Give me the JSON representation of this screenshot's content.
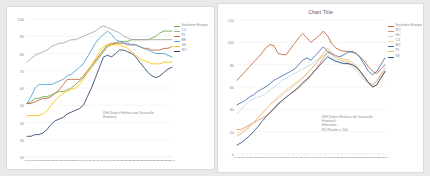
{
  "chart_data": [
    {
      "id": "left",
      "type": "line",
      "title": "",
      "xlabel": "",
      "ylabel": "",
      "ylim": [
        20,
        100
      ],
      "yticks": [
        20,
        30,
        40,
        50,
        60,
        70,
        80,
        90,
        100
      ],
      "grid": true,
      "legend_position": "right",
      "annotation": "IDH (Índice Histórico de Desarrollo\nHumano)",
      "x": [
        "1977",
        "1978",
        "1979",
        "1980",
        "1981",
        "1982",
        "1983",
        "1984",
        "1985",
        "1986",
        "1987",
        "1988",
        "1989",
        "1990",
        "1991",
        "1992",
        "1993",
        "1994",
        "1995",
        "1996",
        "1997",
        "1998",
        "1999",
        "2000",
        "2001",
        "2002",
        "2003",
        "2004",
        "2005",
        "2006",
        "2007",
        "2008",
        "2009",
        "2010",
        "2011",
        "2012",
        "2013"
      ],
      "series": [
        {
          "name": "Southern Europe",
          "color": "#70A845",
          "values": [
            51,
            52,
            54,
            54,
            55,
            55,
            56,
            57,
            58,
            58,
            59,
            60,
            62,
            64,
            66,
            69,
            72,
            75,
            78,
            81,
            84,
            85,
            86,
            87,
            87,
            87,
            88,
            88,
            88,
            88,
            88,
            89,
            90,
            92,
            93,
            93,
            93
          ]
        },
        {
          "name": "LU",
          "color": "#A5A5A5",
          "values": [
            75,
            77,
            79,
            80,
            81,
            82,
            84,
            85,
            86,
            86,
            87,
            88,
            88,
            89,
            90,
            91,
            92,
            93,
            95,
            96,
            95,
            94,
            93,
            92,
            90,
            89,
            88,
            88,
            88,
            88,
            88,
            88,
            88,
            88,
            88,
            88,
            88
          ]
        },
        {
          "name": "PL",
          "color": "#C0653C",
          "values": [
            51,
            51,
            52,
            53,
            54,
            54,
            55,
            57,
            59,
            62,
            65,
            65,
            65,
            65,
            67,
            70,
            73,
            76,
            79,
            82,
            85,
            86,
            86,
            86,
            86,
            85,
            85,
            85,
            84,
            83,
            83,
            82,
            82,
            82,
            83,
            83,
            84
          ]
        },
        {
          "name": "BE",
          "color": "#4F9FD4",
          "values": [
            51,
            55,
            60,
            62,
            62,
            62,
            62,
            63,
            64,
            65,
            67,
            68,
            70,
            72,
            74,
            78,
            82,
            86,
            89,
            91,
            93,
            91,
            88,
            87,
            86,
            86,
            85,
            85,
            84,
            83,
            82,
            81,
            80,
            80,
            80,
            79,
            78
          ]
        },
        {
          "name": "SK",
          "color": "#FFC000",
          "values": [
            44,
            44,
            44,
            44,
            45,
            47,
            50,
            53,
            55,
            57,
            58,
            59,
            60,
            62,
            65,
            69,
            73,
            77,
            81,
            84,
            85,
            85,
            85,
            85,
            84,
            83,
            81,
            79,
            77,
            76,
            75,
            74,
            74,
            74,
            75,
            75,
            75
          ]
        },
        {
          "name": "RO",
          "color": "#26456E",
          "values": [
            32,
            32,
            33,
            33,
            34,
            36,
            39,
            41,
            42,
            43,
            45,
            46,
            47,
            48,
            50,
            55,
            60,
            66,
            72,
            78,
            79,
            78,
            80,
            82,
            82,
            81,
            80,
            78,
            75,
            72,
            69,
            67,
            66,
            67,
            69,
            71,
            72
          ]
        }
      ]
    },
    {
      "id": "right",
      "type": "line",
      "title": "Chart Title",
      "xlabel": "",
      "ylabel": "",
      "ylim": [
        0,
        120
      ],
      "yticks": [
        0,
        20,
        40,
        60,
        80,
        100,
        120
      ],
      "grid": true,
      "legend_position": "right",
      "annotation": "IDH (Índice Histórico de Desarrollo\nHumano)\nEducation\nEU Flanker = 100",
      "x": [
        "1977",
        "1978",
        "1979",
        "1980",
        "1981",
        "1982",
        "1983",
        "1984",
        "1985",
        "1986",
        "1987",
        "1988",
        "1989",
        "1990",
        "1991",
        "1992",
        "1993",
        "1994",
        "1995",
        "1996",
        "1997",
        "1998",
        "1999",
        "2000",
        "2001",
        "2002",
        "2003",
        "2004",
        "2005",
        "2006",
        "2007",
        "2008",
        "2009",
        "2010",
        "2011",
        "2012",
        "2013"
      ],
      "series": [
        {
          "name": "Southern Europe",
          "color": "#C0653C",
          "values": [
            66,
            70,
            74,
            78,
            82,
            86,
            90,
            95,
            98,
            97,
            90,
            89,
            89,
            94,
            99,
            104,
            108,
            104,
            100,
            103,
            106,
            110,
            106,
            99,
            95,
            93,
            92,
            92,
            91,
            90,
            87,
            83,
            78,
            74,
            72,
            76,
            80
          ]
        },
        {
          "name": "RO",
          "color": "#D9945F",
          "values": [
            22,
            22,
            24,
            26,
            28,
            30,
            32,
            34,
            37,
            40,
            44,
            48,
            51,
            54,
            56,
            59,
            63,
            66,
            70,
            75,
            80,
            86,
            91,
            89,
            86,
            84,
            83,
            82,
            80,
            77,
            73,
            68,
            63,
            60,
            62,
            68,
            73
          ]
        },
        {
          "name": "HU",
          "color": "#BFDCEF",
          "values": [
            36,
            40,
            44,
            47,
            49,
            51,
            52,
            54,
            57,
            60,
            63,
            66,
            68,
            70,
            72,
            74,
            76,
            78,
            80,
            83,
            86,
            88,
            89,
            86,
            84,
            82,
            81,
            80,
            78,
            75,
            70,
            66,
            63,
            62,
            66,
            72,
            78
          ]
        },
        {
          "name": "CZ",
          "color": "#F3D9A8",
          "values": [
            18,
            20,
            22,
            25,
            28,
            32,
            36,
            40,
            44,
            48,
            52,
            55,
            58,
            61,
            63,
            66,
            69,
            72,
            76,
            80,
            84,
            88,
            92,
            89,
            86,
            84,
            83,
            82,
            80,
            77,
            73,
            68,
            64,
            62,
            65,
            70,
            74
          ]
        },
        {
          "name": "BG",
          "color": "#3A6FB0",
          "values": [
            44,
            46,
            48,
            51,
            53,
            56,
            58,
            60,
            63,
            66,
            68,
            70,
            72,
            74,
            76,
            80,
            84,
            86,
            84,
            88,
            92,
            96,
            92,
            90,
            88,
            87,
            89,
            91,
            92,
            90,
            86,
            80,
            74,
            71,
            74,
            80,
            86
          ]
        },
        {
          "name": "PL",
          "color": "#E8B87A",
          "values": [
            16,
            18,
            21,
            24,
            28,
            32,
            36,
            40,
            44,
            47,
            50,
            53,
            56,
            59,
            62,
            65,
            68,
            72,
            76,
            80,
            85,
            90,
            95,
            91,
            88,
            86,
            85,
            84,
            82,
            79,
            74,
            69,
            64,
            62,
            65,
            71,
            76
          ]
        },
        {
          "name": "SK",
          "color": "#2D4E7E",
          "values": [
            8,
            10,
            13,
            16,
            20,
            24,
            29,
            33,
            37,
            41,
            45,
            48,
            51,
            54,
            57,
            60,
            64,
            67,
            71,
            75,
            79,
            83,
            87,
            85,
            83,
            82,
            81,
            81,
            80,
            78,
            74,
            69,
            64,
            60,
            62,
            68,
            74
          ]
        }
      ]
    }
  ]
}
